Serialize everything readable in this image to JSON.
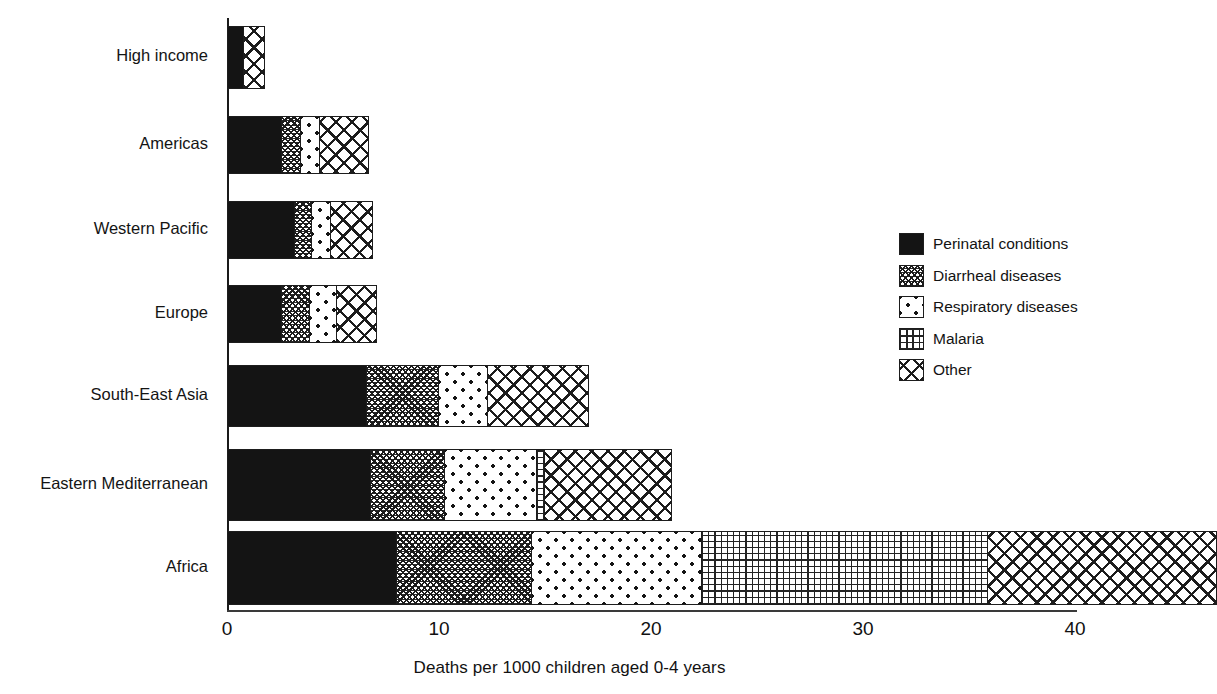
{
  "chart_data": {
    "type": "bar",
    "orientation": "horizontal",
    "stacked": true,
    "title": "",
    "subtitle": "",
    "xlabel": "Deaths per 1000 children aged 0-4 years",
    "ylabel": "",
    "xlim": [
      0,
      40
    ],
    "xticks": [
      0,
      10,
      20,
      30,
      40
    ],
    "xtick_labels": [
      "0",
      "10",
      "20",
      "30",
      "40"
    ],
    "grid": false,
    "legend_position": "right",
    "categories": [
      "High income",
      "Americas",
      "Western Pacific",
      "Europe",
      "South-East Asia",
      "Eastern Mediterranean",
      "Africa"
    ],
    "series": [
      {
        "name": "Perinatal conditions",
        "pattern": "bold-black-grid",
        "values": [
          0.8,
          2.6,
          3.2,
          2.6,
          6.6,
          6.8,
          8.0
        ]
      },
      {
        "name": "Diarrheal diseases",
        "pattern": "dense-crosshatch",
        "values": [
          0.0,
          0.9,
          0.8,
          1.3,
          3.4,
          3.5,
          6.4
        ]
      },
      {
        "name": "Respiratory diseases",
        "pattern": "sparse-dots",
        "values": [
          0.0,
          0.9,
          0.9,
          1.3,
          2.3,
          4.3,
          8.0
        ]
      },
      {
        "name": "Malaria",
        "pattern": "fine-grid",
        "values": [
          0.0,
          0.0,
          0.0,
          0.0,
          0.0,
          0.4,
          13.5
        ]
      },
      {
        "name": "Other",
        "pattern": "diagonal-crosshatch",
        "values": [
          1.0,
          2.3,
          2.0,
          1.9,
          4.8,
          6.0,
          10.8
        ]
      }
    ],
    "totals": [
      1.8,
      6.7,
      6.9,
      7.1,
      17.1,
      21.0,
      38.7
    ]
  },
  "legend": {
    "items": [
      {
        "label": "Perinatal conditions",
        "pattern_class": "pat-perinatal"
      },
      {
        "label": "Diarrheal diseases",
        "pattern_class": "pat-diarrheal"
      },
      {
        "label": "Respiratory diseases",
        "pattern_class": "pat-respiratory"
      },
      {
        "label": "Malaria",
        "pattern_class": "pat-malaria"
      },
      {
        "label": "Other",
        "pattern_class": "pat-other"
      }
    ]
  },
  "colors": {
    "ink": "#1a1a1a",
    "background": "#ffffff"
  }
}
